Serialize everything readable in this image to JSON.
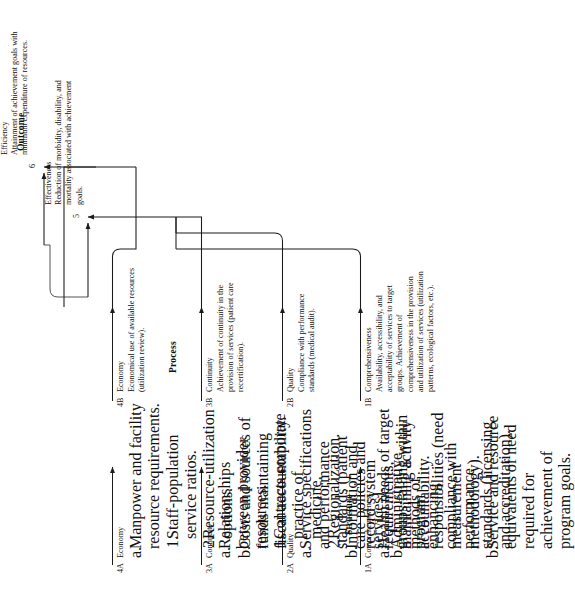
{
  "figure": {
    "columns": [
      {
        "id": "structure",
        "label": "Structure"
      },
      {
        "id": "process",
        "label": "Process"
      },
      {
        "id": "outcome",
        "label": "Outcome"
      }
    ],
    "structure": [
      {
        "code": "1A",
        "title": "Comprehensiveness",
        "items": [
          {
            "mark": "a.",
            "text": "Health needs of target groups falling within program responsibilities (need measurement methodology)."
          },
          {
            "mark": "b.",
            "text": "Service and resource equivalents of need required for achievement of program goals."
          }
        ]
      },
      {
        "code": "2A",
        "title": "Quality",
        "items": [
          {
            "mark": "a.",
            "text": "Service specifications and performance standards (patient care policies and services)."
          },
          {
            "mark": "b.",
            "text": "Administrative methods of enhancing compliance with performance standards (licensing and accreditation)."
          }
        ]
      },
      {
        "code": "3A",
        "title": "Continuity",
        "items": [
          {
            "mark": "a.",
            "text": "Relationships between provider resources."
          },
          {
            "mark": "1.",
            "text": "Contracts corporate practice of medicine.",
            "sub": true
          },
          {
            "mark": "2.",
            "text": "Regionalization.",
            "sub": true
          },
          {
            "mark": "b.",
            "text": "Information and record system requirements, maintaining activity accountability."
          }
        ]
      },
      {
        "code": "4A",
        "title": "Economy",
        "items": [
          {
            "mark": "a.",
            "text": "Manpower and facility resource requirements."
          },
          {
            "mark": "1.",
            "text": "Staff-population service ratios.",
            "sub": true
          },
          {
            "mark": "2.",
            "text": "Resource-utilization options.",
            "sub": true
          },
          {
            "mark": "b.",
            "text": "Costs and sources of funds maintaining fiscal accountability."
          }
        ]
      }
    ],
    "process": [
      {
        "code": "1B",
        "title": "Comprehensiveness",
        "text": "Availability, accessibility, and acceptability of services to target groups.  Achievement of comprehensiveness in the provision and utilization of services (utilization patterns, ecological factors, etc.)."
      },
      {
        "code": "2B",
        "title": "Quality",
        "text": "Compliance with performance standards (medical audit)."
      },
      {
        "code": "3B",
        "title": "Continuity",
        "text": "Achievement of continuity in the provision of services (patient care recertification)."
      },
      {
        "code": "4B",
        "title": "Economy",
        "text": "Economical use of available resources (utilization review)."
      }
    ],
    "outcome": [
      {
        "code": "5",
        "title": "Effectiveness",
        "text": "Reduction of morbidity, disability, and mortality associated with achievement goals."
      },
      {
        "code": "6",
        "title": "Efficiency",
        "text": "Attainment of achievement goals with minimum expenditure of resources."
      }
    ]
  }
}
